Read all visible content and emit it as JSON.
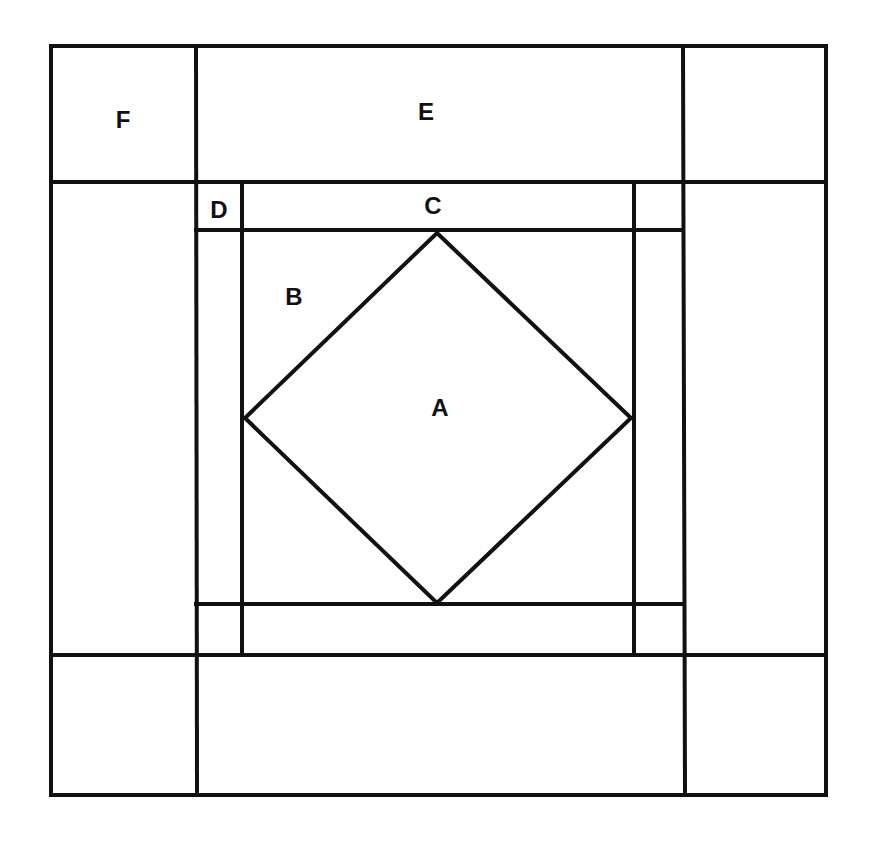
{
  "diagram": {
    "type": "quilt-block-pattern",
    "stroke_color": "#111111",
    "background": "#ffffff",
    "labels": [
      {
        "id": "F",
        "text": "F",
        "x": 123,
        "y": 120
      },
      {
        "id": "E",
        "text": "E",
        "x": 426,
        "y": 112
      },
      {
        "id": "D",
        "text": "D",
        "x": 219,
        "y": 210
      },
      {
        "id": "C",
        "text": "C",
        "x": 433,
        "y": 206
      },
      {
        "id": "B",
        "text": "B",
        "x": 294,
        "y": 297
      },
      {
        "id": "A",
        "text": "A",
        "x": 440,
        "y": 408
      }
    ]
  }
}
